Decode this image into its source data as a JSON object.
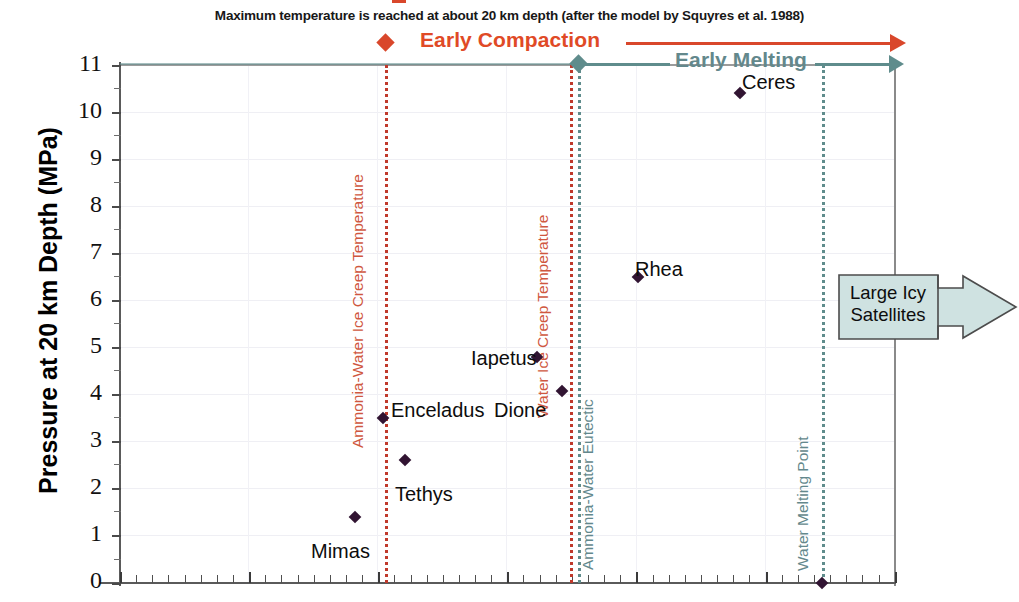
{
  "chart_data": {
    "type": "scatter",
    "title": "Maximum temperature is reached at about 20 km depth (after the model by Squyres et al. 1988)",
    "xlabel": "",
    "ylabel": "Pressure at 20 km Depth (MPa)",
    "ylim": [
      0,
      11
    ],
    "y_ticks": [
      11,
      10,
      9,
      8,
      7,
      6,
      5,
      4,
      3,
      2,
      1,
      0
    ],
    "grid": true,
    "legend": "none",
    "points": [
      {
        "name": "Mimas",
        "x_px": 355,
        "y": 1.4,
        "label_dx": -44,
        "label_dy": 36
      },
      {
        "name": "Tethys",
        "x_px": 405,
        "y": 2.62,
        "label_dx": -10,
        "label_dy": 36
      },
      {
        "name": "Enceladus",
        "x_px": 383,
        "y": 3.5,
        "label_dx": 8,
        "label_dy": -6
      },
      {
        "name": "Dione",
        "x_px": 562,
        "y": 4.08,
        "label_dx": -68,
        "label_dy": 21
      },
      {
        "name": "Iapetus",
        "x_px": 537,
        "y": 4.8,
        "label_dx": -66,
        "label_dy": 3
      },
      {
        "name": "Rhea",
        "x_px": 638,
        "y": 6.5,
        "label_dx": -3,
        "label_dy": -6
      },
      {
        "name": "Ceres",
        "x_px": 740,
        "y": 10.4,
        "label_dx": 2,
        "label_dy": -9
      },
      {
        "name": "",
        "x_px": 822,
        "y": 0.0,
        "label_dx": 0,
        "label_dy": 0
      }
    ],
    "threshold_lines": [
      {
        "name": "Ammonia-Water Ice Creep Temperature",
        "x_px": 385,
        "color": "#cf5740",
        "style": "dotted",
        "label_bottom_px": 430
      },
      {
        "name": "Water Ice Creep Temperature",
        "x_px": 570,
        "color": "#cf5740",
        "style": "dotted",
        "label_bottom_px": 400
      },
      {
        "name": "Ammonia-Water Eutectic",
        "x_px": 578,
        "color": "#63888c",
        "style": "dotted",
        "label_bottom_px": 552
      },
      {
        "name": "Water Melting Point",
        "x_px": 822,
        "color": "#63888c",
        "style": "dotted",
        "label_bottom_px": 553
      }
    ],
    "annotations": [
      {
        "name": "Early Compaction",
        "color": "#e04a26",
        "text_x": 420,
        "text_y": 30
      },
      {
        "name": "Early Melting",
        "color": "#63888c",
        "text_x": 675,
        "text_y": 50
      }
    ],
    "callout": {
      "line1": "Large Icy",
      "line2": "Satellites",
      "fill": "#cfe2e1",
      "stroke": "#4c4c4c"
    }
  }
}
